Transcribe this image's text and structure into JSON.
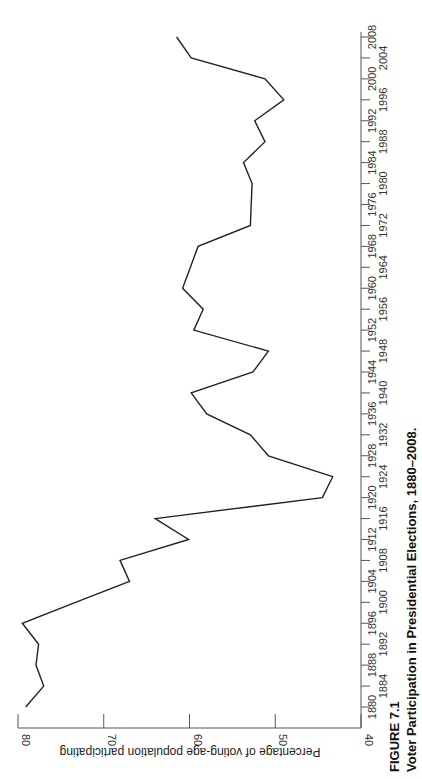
{
  "figure": {
    "number": "FIGURE 7.1",
    "title": "Voter Participation in Presidential Elections, 1880–2008."
  },
  "colors": {
    "line": "#222222",
    "axis": "#555555",
    "background": "#ffffff"
  },
  "chart_data": {
    "type": "line",
    "title": "Voter Participation in Presidential Elections, 1880–2008.",
    "xlabel": "",
    "ylabel": "Percentage of voting-age population participating",
    "orientation": "rotated 90° counter-clockwise (years run bottom-to-top along right edge; percentage axis runs along bottom, 80 at left to 40 at right)",
    "ylim": [
      40,
      80
    ],
    "xlim": [
      1880,
      2008
    ],
    "grid": false,
    "legend": null,
    "y_ticks": [
      80,
      70,
      60,
      50,
      40
    ],
    "x_ticks": [
      1880,
      1884,
      1888,
      1892,
      1896,
      1900,
      1904,
      1908,
      1912,
      1916,
      1920,
      1924,
      1928,
      1932,
      1936,
      1940,
      1944,
      1948,
      1952,
      1956,
      1960,
      1964,
      1968,
      1972,
      1976,
      1980,
      1984,
      1988,
      1992,
      1996,
      2000,
      2004,
      2008
    ],
    "x": [
      1880,
      1884,
      1888,
      1892,
      1896,
      1900,
      1904,
      1908,
      1912,
      1916,
      1920,
      1924,
      1928,
      1932,
      1936,
      1940,
      1944,
      1948,
      1952,
      1956,
      1960,
      1964,
      1968,
      1972,
      1976,
      1980,
      1984,
      1988,
      1992,
      1996,
      2000,
      2004,
      2008
    ],
    "series": [
      {
        "name": "Voter participation (%)",
        "values": [
          79.1,
          77.0,
          77.9,
          77.6,
          79.5,
          73.3,
          67.0,
          68.1,
          60.1,
          64.0,
          44.5,
          43.3,
          50.8,
          52.9,
          58.0,
          59.8,
          52.6,
          50.8,
          59.5,
          58.4,
          60.8,
          59.9,
          59.0,
          52.9,
          52.8,
          52.7,
          53.7,
          51.2,
          52.4,
          49.0,
          51.2,
          59.8,
          61.5
        ]
      }
    ]
  }
}
